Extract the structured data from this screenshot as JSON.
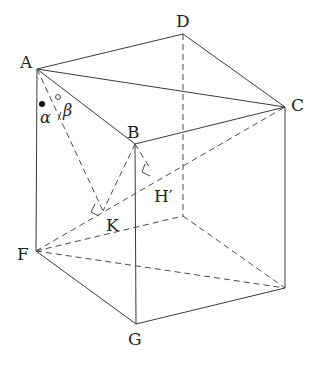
{
  "diagram": {
    "type": "cube-geometry",
    "vertices": {
      "A": {
        "label": "A",
        "x": 37,
        "y": 69,
        "lx": 20,
        "ly": 68
      },
      "B": {
        "label": "B",
        "x": 135,
        "y": 144,
        "lx": 127,
        "ly": 138
      },
      "C": {
        "label": "C",
        "x": 285,
        "y": 107,
        "lx": 291,
        "ly": 111
      },
      "D": {
        "label": "D",
        "x": 183,
        "y": 34,
        "lx": 176,
        "ly": 27
      },
      "F": {
        "label": "F",
        "x": 36,
        "y": 251,
        "lx": 17,
        "ly": 260
      },
      "G": {
        "label": "G",
        "x": 136,
        "y": 324,
        "lx": 128,
        "ly": 345
      },
      "E_hidden": {
        "x": 183,
        "y": 216
      },
      "R_bottom": {
        "x": 285,
        "y": 288
      },
      "K": {
        "label": "K",
        "x": 103,
        "y": 211,
        "lx": 106,
        "ly": 231
      },
      "H_prime": {
        "label": "H′",
        "x": 151,
        "y": 170,
        "lx": 154,
        "ly": 202
      }
    },
    "angle_labels": {
      "alpha": "α",
      "beta": "β"
    },
    "markers": {
      "filled_dot": {
        "x": 42,
        "y": 104
      },
      "open_dot": {
        "x": 58,
        "y": 97
      }
    }
  }
}
